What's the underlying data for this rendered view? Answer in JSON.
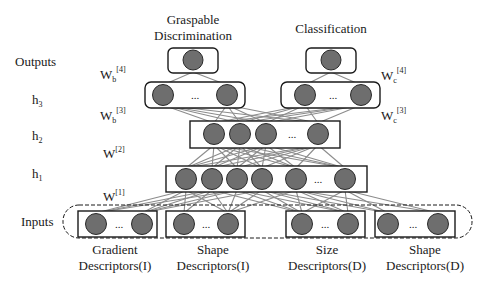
{
  "colors": {
    "node_fill": "#6e6e6e",
    "node_stroke": "#2a2a2a",
    "edge": "#8c8c8c",
    "box_stroke": "#1a1a1a",
    "text": "#1a1a1a"
  },
  "row_labels": {
    "outputs": "Outputs",
    "h3": "h",
    "h3_sub": "3",
    "h2": "h",
    "h2_sub": "2",
    "h1": "h",
    "h1_sub": "1",
    "inputs": "Inputs"
  },
  "weights": {
    "wb4": {
      "base": "W",
      "sub": "b",
      "sup": "[4]"
    },
    "wb3": {
      "base": "W",
      "sub": "b",
      "sup": "[3]"
    },
    "wc4": {
      "base": "W",
      "sub": "c",
      "sup": "[4]"
    },
    "wc3": {
      "base": "W",
      "sub": "c",
      "sup": "[3]"
    },
    "w2": {
      "base": "W",
      "sup": "[2]"
    },
    "w1": {
      "base": "W",
      "sup": "[1]"
    }
  },
  "outputs": {
    "graspable": {
      "line1": "Graspable",
      "line2": "Discrimination"
    },
    "classification": {
      "line1": "Classification"
    }
  },
  "ellipsis": "...",
  "inputs": [
    {
      "line1": "Gradient",
      "line2": "Descriptors(I)"
    },
    {
      "line1": "Shape",
      "line2": "Descriptors(I)"
    },
    {
      "line1": "Size",
      "line2": "Descriptors(D)"
    },
    {
      "line1": "Shape",
      "line2": "Descriptors(D)"
    }
  ]
}
